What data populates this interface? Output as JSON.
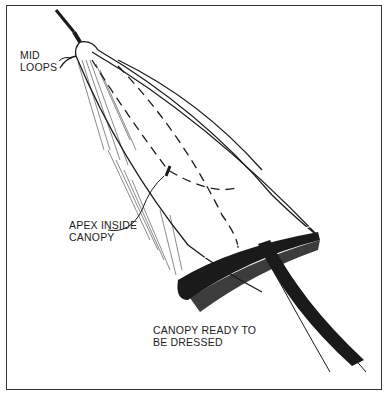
{
  "figure": {
    "labels": {
      "mid_loops": [
        "MID",
        "LOOPS"
      ],
      "apex_inside": [
        "APEX INSIDE",
        "CANOPY"
      ],
      "ready": [
        "CANOPY READY TO",
        "BE DRESSED"
      ]
    },
    "colors": {
      "ink": "#1a1a1a",
      "background": "#ffffff",
      "frame": "#333333"
    }
  }
}
